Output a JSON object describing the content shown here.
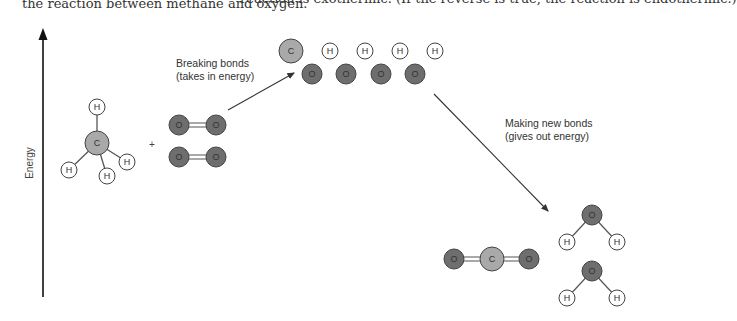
{
  "captions": {
    "left": "the reaction between methane and oxygen.",
    "right": "reaction is exothermic. (If the reverse is true, the reaction is endothermic.)"
  },
  "axis": {
    "label": "Energy"
  },
  "annotations": {
    "breaking_line1": "Breaking bonds",
    "breaking_line2": "(takes in energy)",
    "making_line1": "Making new bonds",
    "making_line2": "(gives out energy)"
  },
  "operators": {
    "plus": "+"
  },
  "atom_labels": {
    "carbon": "C",
    "hydrogen": "H",
    "oxygen": "O"
  },
  "colors": {
    "carbon": "#a9a9a9",
    "oxygen": "#6e6e6e",
    "hydrogen": "#ffffff",
    "stroke": "#444444",
    "bond": "#555555"
  },
  "molecules": {
    "reactants": [
      "CH4",
      "O2",
      "O2"
    ],
    "intermediate": [
      "C",
      "H",
      "H",
      "H",
      "H",
      "O",
      "O",
      "O",
      "O"
    ],
    "products": [
      "CO2",
      "H2O",
      "H2O"
    ]
  }
}
